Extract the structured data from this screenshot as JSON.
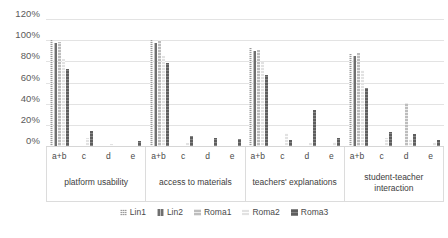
{
  "chart_data": {
    "type": "bar",
    "title": "",
    "subtitle": "",
    "xlabel": "",
    "ylabel": "",
    "ylim": [
      0,
      120
    ],
    "ytick_labels": [
      "120%",
      "100%",
      "80%",
      "60%",
      "40%",
      "20%",
      "0%"
    ],
    "ytick_values": [
      120,
      100,
      80,
      60,
      40,
      20,
      0
    ],
    "grid": true,
    "legend_position": "bottom",
    "series_names": [
      "Lin1",
      "Lin2",
      "Roma1",
      "Roma2",
      "Roma3"
    ],
    "subcategories": [
      "a+b",
      "c",
      "d",
      "e"
    ],
    "categories": [
      "platform usability",
      "access to materials",
      "teachers' explanations",
      "student-teacher interaction"
    ],
    "groups": [
      {
        "category": "platform usability",
        "subgroups": [
          {
            "label": "a+b",
            "values": [
              100,
              97,
              98,
              82,
              73
            ]
          },
          {
            "label": "c",
            "values": [
              0,
              0,
              0,
              8,
              14
            ]
          },
          {
            "label": "d",
            "values": [
              0,
              0,
              0,
              2,
              0
            ]
          },
          {
            "label": "e",
            "values": [
              0,
              0,
              0,
              0,
              5
            ]
          }
        ]
      },
      {
        "category": "access to materials",
        "subgroups": [
          {
            "label": "a+b",
            "values": [
              100,
              97,
              100,
              85,
              78
            ]
          },
          {
            "label": "c",
            "values": [
              0,
              0,
              0,
              3,
              9
            ]
          },
          {
            "label": "d",
            "values": [
              0,
              0,
              0,
              0,
              8
            ]
          },
          {
            "label": "e",
            "values": [
              0,
              0,
              0,
              0,
              7
            ]
          }
        ]
      },
      {
        "category": "teachers' explanations",
        "subgroups": [
          {
            "label": "a+b",
            "values": [
              93,
              90,
              91,
              79,
              67
            ]
          },
          {
            "label": "c",
            "values": [
              0,
              0,
              0,
              12,
              6
            ]
          },
          {
            "label": "d",
            "values": [
              0,
              0,
              0,
              3,
              34
            ]
          },
          {
            "label": "e",
            "values": [
              0,
              0,
              0,
              4,
              8
            ]
          }
        ]
      },
      {
        "category": "student-teacher interaction",
        "subgroups": [
          {
            "label": "a+b",
            "values": [
              87,
              85,
              88,
              72,
              55
            ]
          },
          {
            "label": "c",
            "values": [
              0,
              0,
              0,
              8,
              13
            ]
          },
          {
            "label": "d",
            "values": [
              0,
              0,
              41,
              7,
              11
            ]
          },
          {
            "label": "e",
            "values": [
              0,
              0,
              0,
              3,
              6
            ]
          }
        ]
      }
    ],
    "series_colors": {
      "Lin1": "#9a9a9a",
      "Lin2": "#6f6f6f",
      "Roma1": "#bdbdbd",
      "Roma2": "#e2e2e2",
      "Roma3": "#5e5e5e"
    }
  },
  "legend": {
    "items": [
      {
        "label": "Lin1",
        "swatch": "lin1-swatch"
      },
      {
        "label": "Lin2",
        "swatch": "lin2-swatch"
      },
      {
        "label": "Roma1",
        "swatch": "roma1-swatch"
      },
      {
        "label": "Roma2",
        "swatch": "roma2-swatch"
      },
      {
        "label": "Roma3",
        "swatch": "roma3-swatch"
      }
    ]
  }
}
